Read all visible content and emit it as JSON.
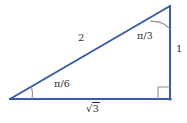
{
  "figure": {
    "name": "right-triangle-30-60-90",
    "canvas": {
      "width": 187,
      "height": 123,
      "background": "#ffffff"
    },
    "colors": {
      "stroke": "#3a5ba9",
      "marker": "#8a8a8a",
      "text": "#2f2f2f"
    },
    "vertices": {
      "left": {
        "x": 10,
        "y": 99
      },
      "top_right": {
        "x": 170,
        "y": 6
      },
      "bottom_right": {
        "x": 170,
        "y": 99
      }
    },
    "labels": {
      "hypotenuse": "2",
      "vertical_leg": "1",
      "base_leg_sign": "√",
      "base_leg_arg": "3",
      "angle_top": "π/3",
      "angle_left": "π/6"
    },
    "markers": {
      "right_angle": "right-angle-square",
      "arc_top": "angle-arc",
      "arc_left": "angle-arc"
    }
  }
}
